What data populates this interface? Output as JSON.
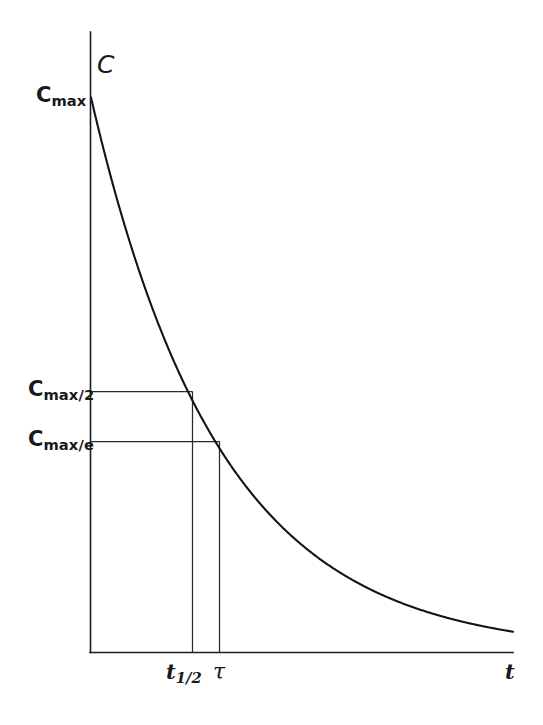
{
  "figure": {
    "background_color": "#ffffff",
    "line_color": "#141414",
    "width": 543,
    "height": 725
  },
  "labels": {
    "y_axis_name": "C",
    "y_axis_name_full": "C",
    "x_axis_name": "t",
    "cmax_base": "C",
    "cmax_sub": "max",
    "cmax2_base": "C",
    "cmax2_sub": "max/2",
    "cmaxe_base": "C",
    "cmaxe_sub": "max/e",
    "thalf_base": "t",
    "thalf_sub": "1/2",
    "tau": "τ"
  },
  "chart_data": {
    "type": "line",
    "title": "",
    "subtitle": "",
    "xlabel": "t",
    "ylabel": "C",
    "grid": false,
    "legend": null,
    "curve": {
      "name": "exponential decay",
      "equation": "C(t) = C_max * exp(-t / tau)",
      "description": "First-order exponential decay of concentration C with time t",
      "x": [
        0,
        0.1,
        0.2,
        0.3,
        0.4,
        0.5,
        0.6,
        0.7,
        0.8,
        0.9,
        1.0,
        1.2,
        1.4,
        1.6,
        1.8,
        2.0,
        2.2,
        2.4,
        2.6,
        2.8,
        3.0,
        3.2,
        3.4,
        3.6,
        3.8,
        4.0,
        4.2,
        4.4,
        4.6,
        4.8,
        5.0
      ],
      "y": [
        1.0,
        0.905,
        0.819,
        0.741,
        0.67,
        0.607,
        0.549,
        0.497,
        0.449,
        0.407,
        0.368,
        0.301,
        0.247,
        0.202,
        0.165,
        0.135,
        0.111,
        0.091,
        0.074,
        0.061,
        0.05,
        0.041,
        0.033,
        0.027,
        0.022,
        0.018,
        0.015,
        0.012,
        0.01,
        0.008,
        0.007
      ]
    },
    "xlim": [
      0,
      5
    ],
    "ylim": [
      0,
      1
    ],
    "y_ticks": [
      {
        "label": "C_max",
        "value": 1.0
      },
      {
        "label": "C_max/2",
        "value": 0.5
      },
      {
        "label": "C_max/e",
        "value": 0.368
      }
    ],
    "x_ticks": [
      {
        "label": "t_1/2",
        "value": 0.693
      },
      {
        "label": "tau",
        "value": 1.0
      }
    ],
    "annotations": [
      {
        "name": "half-life guide",
        "type": "hline+vline",
        "y": 0.5,
        "x": 0.693
      },
      {
        "name": "time-constant guide",
        "type": "hline+vline",
        "y": 0.368,
        "x": 1.0
      }
    ]
  }
}
